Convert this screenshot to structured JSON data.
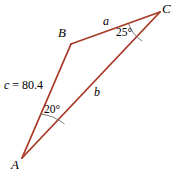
{
  "figure": {
    "type": "triangle-diagram",
    "stroke_color": "#A83A28",
    "arc_color": "#555555",
    "text_color": "#000000",
    "background_color": "#ffffff",
    "width": 176,
    "height": 177
  },
  "vertices": {
    "A": {
      "label": "A",
      "x": 22,
      "y": 158
    },
    "B": {
      "label": "B",
      "x": 71,
      "y": 44
    },
    "C": {
      "label": "C",
      "x": 160,
      "y": 12
    }
  },
  "sides": {
    "a": {
      "label": "a",
      "from": "B",
      "to": "C"
    },
    "b": {
      "label": "b",
      "from": "A",
      "to": "C"
    },
    "c": {
      "label": "c = 80.4",
      "variable": "c",
      "equals": " = 80.4",
      "value": 80.4,
      "from": "A",
      "to": "B"
    }
  },
  "angles": {
    "A": {
      "label": "20°",
      "value": 20,
      "at": "A"
    },
    "C": {
      "label": "25°",
      "value": 25,
      "at": "C"
    }
  }
}
